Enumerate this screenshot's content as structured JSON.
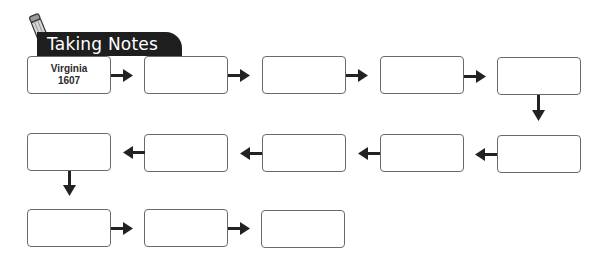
{
  "header": {
    "title": "Taking Notes",
    "icon": "pencil-icon",
    "banner_color": "#1e1e1e"
  },
  "flowchart": {
    "box_border_color": "#6a6a6a",
    "arrow_color": "#222222",
    "boxes": [
      {
        "row": 1,
        "col": 1,
        "lines": [
          "Virginia",
          "1607"
        ]
      },
      {
        "row": 1,
        "col": 2,
        "lines": [
          "",
          ""
        ]
      },
      {
        "row": 1,
        "col": 3,
        "lines": [
          "",
          ""
        ]
      },
      {
        "row": 1,
        "col": 4,
        "lines": [
          "",
          ""
        ]
      },
      {
        "row": 1,
        "col": 5,
        "lines": [
          "",
          ""
        ]
      },
      {
        "row": 2,
        "col": 5,
        "lines": [
          "",
          ""
        ]
      },
      {
        "row": 2,
        "col": 4,
        "lines": [
          "",
          ""
        ]
      },
      {
        "row": 2,
        "col": 3,
        "lines": [
          "",
          ""
        ]
      },
      {
        "row": 2,
        "col": 2,
        "lines": [
          "",
          ""
        ]
      },
      {
        "row": 2,
        "col": 1,
        "lines": [
          "",
          ""
        ]
      },
      {
        "row": 3,
        "col": 1,
        "lines": [
          "",
          ""
        ]
      },
      {
        "row": 3,
        "col": 2,
        "lines": [
          "",
          ""
        ]
      },
      {
        "row": 3,
        "col": 3,
        "lines": [
          "",
          ""
        ]
      }
    ],
    "arrows": [
      {
        "from": 1,
        "to": 2,
        "direction": "right"
      },
      {
        "from": 2,
        "to": 3,
        "direction": "right"
      },
      {
        "from": 3,
        "to": 4,
        "direction": "right"
      },
      {
        "from": 4,
        "to": 5,
        "direction": "right"
      },
      {
        "from": 5,
        "to": 6,
        "direction": "down"
      },
      {
        "from": 6,
        "to": 7,
        "direction": "left"
      },
      {
        "from": 7,
        "to": 8,
        "direction": "left"
      },
      {
        "from": 8,
        "to": 9,
        "direction": "left"
      },
      {
        "from": 9,
        "to": 10,
        "direction": "left"
      },
      {
        "from": 10,
        "to": 11,
        "direction": "down"
      },
      {
        "from": 11,
        "to": 12,
        "direction": "right"
      },
      {
        "from": 12,
        "to": 13,
        "direction": "right"
      }
    ]
  }
}
